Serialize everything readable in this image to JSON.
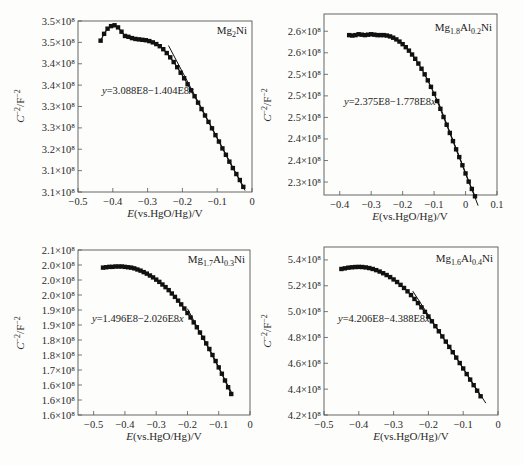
{
  "chart_data": [
    {
      "type": "scatter",
      "panel_label": "Mg2Ni",
      "panel_label_parts": [
        {
          "t": "Mg",
          "sub": false
        },
        {
          "t": "2",
          "sub": true
        },
        {
          "t": "Ni",
          "sub": false
        }
      ],
      "equation": "y=3.088E8−1.404E8x",
      "xlabel": "E(vs.HgO/Hg)/V",
      "ylabel": "C⁻²/F⁻²",
      "xlim": [
        -0.5,
        0
      ],
      "x_ticks": [
        -0.5,
        -0.4,
        -0.3,
        -0.2,
        -0.1,
        0
      ],
      "x_tick_labels": [
        "−0.5",
        "−0.4",
        "−0.3",
        "−0.2",
        "−0.1",
        "0"
      ],
      "ylim": [
        310000000.0,
        350000000.0
      ],
      "y_ticks": [
        310000000.0,
        315000000.0,
        320000000.0,
        325000000.0,
        330000000.0,
        335000000.0,
        340000000.0,
        345000000.0,
        350000000.0
      ],
      "y_tick_labels": [
        "3.1×10⁸",
        "3.1×10⁸",
        "3.2×10⁸",
        "3.3×10⁸",
        "3.3×10⁸",
        "3.4×10⁸",
        "3.4×10⁸",
        "3.5×10⁸",
        "3.5×10⁸"
      ],
      "fit_line": {
        "x": [
          -0.24,
          -0.02
        ]
      },
      "series": [
        {
          "name": "Mg2Ni",
          "x": [
            -0.435,
            -0.425,
            -0.415,
            -0.405,
            -0.395,
            -0.385,
            -0.375,
            -0.365,
            -0.355,
            -0.345,
            -0.335,
            -0.325,
            -0.315,
            -0.305,
            -0.295,
            -0.285,
            -0.275,
            -0.265,
            -0.255,
            -0.245,
            -0.235,
            -0.225,
            -0.215,
            -0.205,
            -0.195,
            -0.185,
            -0.175,
            -0.165,
            -0.155,
            -0.145,
            -0.135,
            -0.125,
            -0.115,
            -0.105,
            -0.095,
            -0.085,
            -0.075,
            -0.065,
            -0.055,
            -0.045,
            -0.035,
            -0.025
          ],
          "y": [
            345400000.0,
            347000000.0,
            348200000.0,
            348800000.0,
            349000000.0,
            348500000.0,
            347500000.0,
            346500000.0,
            346300000.0,
            346000000.0,
            345800000.0,
            345700000.0,
            345600000.0,
            345500000.0,
            345300000.0,
            345000000.0,
            344600000.0,
            344100000.0,
            343400000.0,
            342500000.0,
            341500000.0,
            340400000.0,
            339200000.0,
            337900000.0,
            336600000.0,
            335200000.0,
            333800000.0,
            332400000.0,
            330900000.0,
            329400000.0,
            327900000.0,
            326400000.0,
            324900000.0,
            323300000.0,
            321800000.0,
            320200000.0,
            318700000.0,
            317100000.0,
            315600000.0,
            314200000.0,
            312800000.0,
            311200000.0
          ]
        }
      ]
    },
    {
      "type": "scatter",
      "panel_label": "Mg1.8Al0.2Ni",
      "panel_label_parts": [
        {
          "t": "Mg",
          "sub": false
        },
        {
          "t": "1.8",
          "sub": true
        },
        {
          "t": "Al",
          "sub": false
        },
        {
          "t": "0.2",
          "sub": true
        },
        {
          "t": "Ni",
          "sub": false
        }
      ],
      "equation": "y=2.375E8−1.778E8x",
      "xlabel": "E(vs.HgO/Hg)/V",
      "ylabel": "C⁻²/F⁻²",
      "xlim": [
        -0.45,
        0.1
      ],
      "x_ticks": [
        -0.4,
        -0.3,
        -0.2,
        -0.1,
        0,
        0.1
      ],
      "x_tick_labels": [
        "−0.4",
        "−0.3",
        "−0.2",
        "−0.1",
        "0",
        "0.1"
      ],
      "ylim": [
        222000000.0,
        264000000.0
      ],
      "y_ticks": [
        225000000.0,
        230000000.0,
        235000000.0,
        240000000.0,
        245000000.0,
        250000000.0,
        255000000.0,
        260000000.0
      ],
      "y_tick_labels": [
        "2.3×10⁸",
        "2.4×10⁸",
        "2.4×10⁸",
        "2.5×10⁸",
        "2.5×10⁸",
        "2.5×10⁸",
        "2.6×10⁸",
        "2.6×10⁸"
      ],
      "fit_line": {
        "x": [
          -0.09,
          0.04
        ]
      },
      "series": [
        {
          "name": "Mg1.8Al0.2Ni",
          "x": [
            -0.37,
            -0.36,
            -0.35,
            -0.34,
            -0.33,
            -0.32,
            -0.31,
            -0.3,
            -0.29,
            -0.28,
            -0.27,
            -0.26,
            -0.25,
            -0.24,
            -0.23,
            -0.22,
            -0.21,
            -0.2,
            -0.19,
            -0.18,
            -0.17,
            -0.16,
            -0.15,
            -0.14,
            -0.13,
            -0.12,
            -0.11,
            -0.1,
            -0.09,
            -0.08,
            -0.07,
            -0.06,
            -0.05,
            -0.04,
            -0.03,
            -0.02,
            -0.01,
            0.0,
            0.01,
            0.02,
            0.03
          ],
          "y": [
            259100000.0,
            259000000.0,
            259100000.0,
            259300000.0,
            259200000.0,
            259100000.0,
            259200000.0,
            259300000.0,
            259200000.0,
            259100000.0,
            259100000.0,
            259100000.0,
            259000000.0,
            258800000.0,
            258500000.0,
            258100000.0,
            257600000.0,
            257000000.0,
            256300000.0,
            255500000.0,
            254600000.0,
            253600000.0,
            252500000.0,
            251300000.0,
            250000000.0,
            248600000.0,
            247100000.0,
            245500000.0,
            243800000.0,
            242000000.0,
            240100000.0,
            238300000.0,
            236400000.0,
            234500000.0,
            232600000.0,
            230800000.0,
            228900000.0,
            227000000.0,
            225100000.0,
            223400000.0,
            221700000.0
          ]
        }
      ]
    },
    {
      "type": "scatter",
      "panel_label": "Mg1.7Al0.3Ni",
      "panel_label_parts": [
        {
          "t": "Mg",
          "sub": false
        },
        {
          "t": "1.7",
          "sub": true
        },
        {
          "t": "Al",
          "sub": false
        },
        {
          "t": "0.3",
          "sub": true
        },
        {
          "t": "Ni",
          "sub": false
        }
      ],
      "equation": "y=1.496E8−2.026E8x",
      "xlabel": "E(vs.HgO/Hg)/V",
      "ylabel": "C⁻²/F⁻²",
      "xlim": [
        -0.55,
        0
      ],
      "x_ticks": [
        -0.5,
        -0.4,
        -0.3,
        -0.2,
        -0.1,
        0
      ],
      "x_tick_labels": [
        "−0.5",
        "−0.4",
        "−0.3",
        "−0.2",
        "−0.1",
        "0"
      ],
      "ylim": [
        160000000.0,
        204000000.0
      ],
      "y_ticks": [
        160000000.0,
        164000000.0,
        168000000.0,
        172000000.0,
        176000000.0,
        180000000.0,
        184000000.0,
        188000000.0,
        192000000.0,
        196000000.0,
        200000000.0,
        204000000.0
      ],
      "y_tick_labels": [
        "1.6×10⁸",
        "1.6×10⁸",
        "1.6×10⁸",
        "1.7×10⁸",
        "1.8×10⁸",
        "1.8×10⁸",
        "1.9×10⁸",
        "1.9×10⁸",
        "2.0×10⁸",
        "2.0×10⁸",
        "2.0×10⁸",
        "2.1×10⁸"
      ],
      "fit_line": {
        "x": [
          -0.2,
          -0.055
        ]
      },
      "series": [
        {
          "name": "Mg1.7Al0.3Ni",
          "x": [
            -0.47,
            -0.46,
            -0.45,
            -0.44,
            -0.43,
            -0.42,
            -0.41,
            -0.4,
            -0.39,
            -0.38,
            -0.37,
            -0.36,
            -0.35,
            -0.34,
            -0.33,
            -0.32,
            -0.31,
            -0.3,
            -0.29,
            -0.28,
            -0.27,
            -0.26,
            -0.25,
            -0.24,
            -0.23,
            -0.22,
            -0.21,
            -0.2,
            -0.19,
            -0.18,
            -0.17,
            -0.16,
            -0.15,
            -0.14,
            -0.13,
            -0.12,
            -0.11,
            -0.1,
            -0.09,
            -0.08,
            -0.07,
            -0.06
          ],
          "y": [
            199300000.0,
            199400000.0,
            199500000.0,
            199500000.0,
            199600000.0,
            199600000.0,
            199600000.0,
            199500000.0,
            199400000.0,
            199300000.0,
            199100000.0,
            198800000.0,
            198500000.0,
            198100000.0,
            197700000.0,
            197200000.0,
            196700000.0,
            196100000.0,
            195500000.0,
            194800000.0,
            194100000.0,
            193300000.0,
            192400000.0,
            191500000.0,
            190500000.0,
            189500000.0,
            188400000.0,
            187200000.0,
            186000000.0,
            184700000.0,
            183400000.0,
            182000000.0,
            180600000.0,
            179100000.0,
            177600000.0,
            176000000.0,
            174400000.0,
            172700000.0,
            171000000.0,
            169200000.0,
            167400000.0,
            165600000.0
          ]
        }
      ]
    },
    {
      "type": "scatter",
      "panel_label": "Mg1.6Al0.4Ni",
      "panel_label_parts": [
        {
          "t": "Mg",
          "sub": false
        },
        {
          "t": "1.6",
          "sub": true
        },
        {
          "t": "Al",
          "sub": false
        },
        {
          "t": "0.4",
          "sub": true
        },
        {
          "t": "Ni",
          "sub": false
        }
      ],
      "equation": "y=4.206E8−4.388E8x",
      "xlabel": "E(vs.HgO/Hg)/V",
      "ylabel": "C⁻²/F⁻²",
      "xlim": [
        -0.5,
        0
      ],
      "x_ticks": [
        -0.5,
        -0.4,
        -0.3,
        -0.2,
        -0.1,
        0
      ],
      "x_tick_labels": [
        "−0.5",
        "−0.4",
        "−0.3",
        "−0.2",
        "−0.1",
        "0"
      ],
      "ylim": [
        420000000.0,
        550000000.0
      ],
      "y_ticks": [
        420000000.0,
        440000000.0,
        460000000.0,
        480000000.0,
        500000000.0,
        520000000.0,
        540000000.0
      ],
      "y_tick_labels": [
        "4.2×10⁸",
        "4.4×10⁸",
        "4.6×10⁸",
        "4.8×10⁸",
        "5.0×10⁸",
        "5.2×10⁸",
        "5.4×10⁸"
      ],
      "fit_line": {
        "x": [
          -0.245,
          -0.035
        ]
      },
      "series": [
        {
          "name": "Mg1.6Al0.4Ni",
          "x": [
            -0.45,
            -0.44,
            -0.43,
            -0.42,
            -0.41,
            -0.4,
            -0.39,
            -0.38,
            -0.37,
            -0.36,
            -0.35,
            -0.34,
            -0.33,
            -0.32,
            -0.31,
            -0.3,
            -0.29,
            -0.28,
            -0.27,
            -0.26,
            -0.25,
            -0.24,
            -0.23,
            -0.22,
            -0.21,
            -0.2,
            -0.19,
            -0.18,
            -0.17,
            -0.16,
            -0.15,
            -0.14,
            -0.13,
            -0.12,
            -0.11,
            -0.1,
            -0.09,
            -0.08,
            -0.07,
            -0.06,
            -0.05
          ],
          "y": [
            533000000.0,
            533500000.0,
            534000000.0,
            534300000.0,
            534500000.0,
            534600000.0,
            534500000.0,
            534200000.0,
            533700000.0,
            533000000.0,
            532100000.0,
            531000000.0,
            529700000.0,
            528300000.0,
            526700000.0,
            524900000.0,
            522900000.0,
            520700000.0,
            518300000.0,
            515700000.0,
            512800000.0,
            509800000.0,
            506600000.0,
            503300000.0,
            499800000.0,
            496200000.0,
            492500000.0,
            488700000.0,
            484800000.0,
            480800000.0,
            476800000.0,
            472700000.0,
            468600000.0,
            464400000.0,
            460200000.0,
            456000000.0,
            451700000.0,
            447400000.0,
            443100000.0,
            438800000.0,
            434500000.0
          ]
        }
      ]
    }
  ]
}
